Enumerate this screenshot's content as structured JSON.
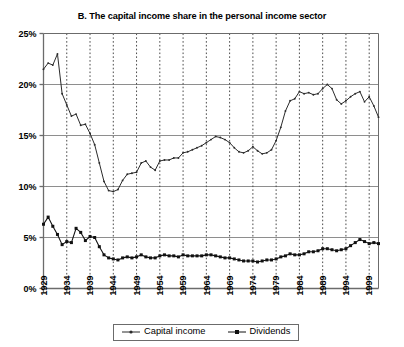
{
  "chart_data": {
    "type": "line",
    "title": "B. The capital income share in the personal income sector",
    "subtitle": "",
    "xlabel": "",
    "ylabel": "",
    "xlim": [
      1929,
      2001
    ],
    "ylim": [
      0,
      25
    ],
    "grid": "horizontal-solid-and-vertical-dotted",
    "legend_position": "bottom-center",
    "y_ticks": [
      0,
      5,
      10,
      15,
      20,
      25
    ],
    "y_tick_labels": [
      "0%",
      "5%",
      "10%",
      "15%",
      "20%",
      "25%"
    ],
    "x_ticks": [
      1929,
      1934,
      1939,
      1944,
      1949,
      1954,
      1959,
      1964,
      1969,
      1974,
      1979,
      1984,
      1989,
      1994,
      1999
    ],
    "x_tick_labels": [
      "1929",
      "1934",
      "1939",
      "1944",
      "1949",
      "1954",
      "1959",
      "1964",
      "1969",
      "1974",
      "1979",
      "1984",
      "1989",
      "1994",
      "1999"
    ],
    "x": [
      1929,
      1930,
      1931,
      1932,
      1933,
      1934,
      1935,
      1936,
      1937,
      1938,
      1939,
      1940,
      1941,
      1942,
      1943,
      1944,
      1945,
      1946,
      1947,
      1948,
      1949,
      1950,
      1951,
      1952,
      1953,
      1954,
      1955,
      1956,
      1957,
      1958,
      1959,
      1960,
      1961,
      1962,
      1963,
      1964,
      1965,
      1966,
      1967,
      1968,
      1969,
      1970,
      1971,
      1972,
      1973,
      1974,
      1975,
      1976,
      1977,
      1978,
      1979,
      1980,
      1981,
      1982,
      1983,
      1984,
      1985,
      1986,
      1987,
      1988,
      1989,
      1990,
      1991,
      1992,
      1993,
      1994,
      1995,
      1996,
      1997,
      1998,
      1999,
      2000,
      2001
    ],
    "series": [
      {
        "name": "Capital income",
        "color": "#2b2b2b",
        "marker": "small-dot",
        "values": [
          21.5,
          22.1,
          21.9,
          23.0,
          19.1,
          18.0,
          16.9,
          17.1,
          16.0,
          16.1,
          15.2,
          14.1,
          12.3,
          10.5,
          9.6,
          9.5,
          9.7,
          10.6,
          11.2,
          11.3,
          11.4,
          12.3,
          12.5,
          11.9,
          11.6,
          12.5,
          12.6,
          12.6,
          12.8,
          12.8,
          13.3,
          13.4,
          13.6,
          13.8,
          14.0,
          14.3,
          14.6,
          14.9,
          14.8,
          14.6,
          14.3,
          13.8,
          13.4,
          13.3,
          13.5,
          13.9,
          13.5,
          13.2,
          13.3,
          13.6,
          14.5,
          15.8,
          17.4,
          18.4,
          18.6,
          19.3,
          19.1,
          19.2,
          19.0,
          19.1,
          19.6,
          20.0,
          19.6,
          18.5,
          18.1,
          18.4,
          18.8,
          19.1,
          19.3,
          18.3,
          18.8,
          17.9,
          16.8
        ],
        "value_range": [
          9.5,
          23.0
        ]
      },
      {
        "name": "Dividends",
        "color": "#111111",
        "marker": "filled-square",
        "values": [
          6.3,
          7.0,
          6.1,
          5.3,
          4.3,
          4.6,
          4.5,
          5.9,
          5.5,
          4.7,
          5.1,
          5.0,
          4.1,
          3.3,
          3.0,
          2.9,
          2.8,
          3.0,
          3.1,
          3.0,
          3.1,
          3.3,
          3.1,
          3.0,
          3.0,
          3.2,
          3.3,
          3.2,
          3.2,
          3.1,
          3.3,
          3.2,
          3.2,
          3.2,
          3.2,
          3.3,
          3.3,
          3.2,
          3.1,
          3.0,
          3.0,
          2.9,
          2.8,
          2.7,
          2.7,
          2.7,
          2.6,
          2.7,
          2.8,
          2.8,
          2.9,
          3.1,
          3.2,
          3.4,
          3.3,
          3.3,
          3.4,
          3.6,
          3.6,
          3.7,
          3.9,
          3.9,
          3.8,
          3.7,
          3.8,
          3.9,
          4.2,
          4.5,
          4.8,
          4.6,
          4.4,
          4.5,
          4.4
        ],
        "value_range": [
          2.6,
          7.0
        ]
      }
    ]
  },
  "legend": {
    "items": [
      {
        "label": "Capital income",
        "marker": "small-dot"
      },
      {
        "label": "Dividends",
        "marker": "filled-square"
      }
    ]
  },
  "colors": {
    "axis": "#6b6b6b",
    "gridline_horizontal": "#8e8e8e",
    "gridline_vertical": "#4a4a4a",
    "series_capital_income": "#2b2b2b",
    "series_dividends": "#111111",
    "background": "#ffffff"
  }
}
